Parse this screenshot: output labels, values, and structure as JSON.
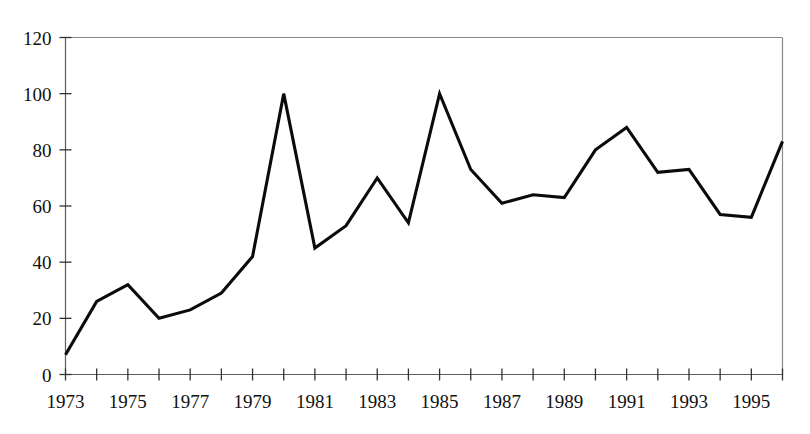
{
  "chart_data": {
    "type": "line",
    "title": "",
    "subtitle": "",
    "xlabel": "",
    "ylabel": "",
    "xlim": [
      1973,
      1996
    ],
    "ylim": [
      0,
      120
    ],
    "grid": false,
    "legend": null,
    "x": [
      1973,
      1974,
      1975,
      1976,
      1977,
      1978,
      1979,
      1980,
      1981,
      1982,
      1983,
      1984,
      1985,
      1986,
      1987,
      1988,
      1989,
      1990,
      1991,
      1992,
      1993,
      1994,
      1995,
      1996
    ],
    "values": [
      7,
      26,
      32,
      20,
      23,
      29,
      42,
      100,
      45,
      53,
      70,
      54,
      100,
      73,
      61,
      64,
      63,
      80,
      88,
      72,
      73,
      57,
      56,
      83
    ],
    "series": [
      {
        "name": "series-1",
        "color": "#0b0b0b",
        "values": [
          7,
          26,
          32,
          20,
          23,
          29,
          42,
          100,
          45,
          53,
          70,
          54,
          100,
          73,
          61,
          64,
          63,
          80,
          88,
          72,
          73,
          57,
          56,
          83
        ]
      }
    ],
    "y_ticks": [
      0,
      20,
      40,
      60,
      80,
      100,
      120
    ],
    "y_tick_labels": [
      "0",
      "20",
      "40",
      "60",
      "80",
      "100",
      "120"
    ],
    "x_ticks": [
      1973,
      1974,
      1975,
      1976,
      1977,
      1978,
      1979,
      1980,
      1981,
      1982,
      1983,
      1984,
      1985,
      1986,
      1987,
      1988,
      1989,
      1990,
      1991,
      1992,
      1993,
      1994,
      1995,
      1996
    ],
    "x_tick_labels": [
      "1973",
      "",
      "1975",
      "",
      "1977",
      "",
      "1979",
      "",
      "1981",
      "",
      "1983",
      "",
      "1985",
      "",
      "1987",
      "",
      "1989",
      "",
      "1991",
      "",
      "1993",
      "",
      "1995",
      ""
    ],
    "x_labeled": [
      "1973",
      "1975",
      "1977",
      "1979",
      "1981",
      "1983",
      "1985",
      "1987",
      "1989",
      "1991",
      "1993",
      "1995"
    ],
    "colors": {
      "line": "#0b0b0b",
      "axis": "#5c5c5c",
      "frame": "#8a8a8a",
      "text": "#111111",
      "background": "#ffffff"
    }
  }
}
